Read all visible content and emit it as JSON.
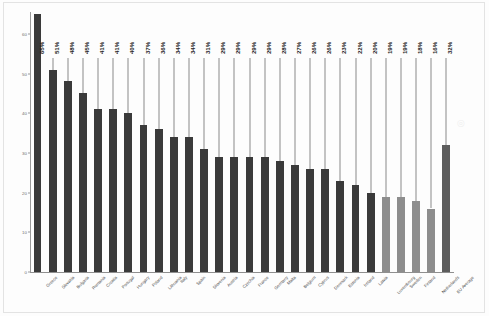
{
  "chart_data": {
    "type": "bar",
    "title": "",
    "subtitle": "",
    "xlabel": "",
    "ylabel": "",
    "ylim": [
      0,
      65
    ],
    "yticks": [
      0,
      10,
      20,
      30,
      40,
      50,
      60
    ],
    "grid": false,
    "legend_position": "none",
    "value_label_suffix": "%",
    "categories": [
      "Greece",
      "Slovakia",
      "Bulgaria",
      "Romania",
      "Croatia",
      "Portugal",
      "Hungary",
      "Poland",
      "Lithuania",
      "Italy",
      "Spain",
      "Slovenia",
      "Austria",
      "Czechia",
      "France",
      "Germany",
      "Malta",
      "Belgium",
      "Cyprus",
      "Denmark",
      "Estonia",
      "Ireland",
      "Latvia",
      "Luxembourg",
      "Sweden",
      "Finland",
      "Netherlands",
      "EU Average"
    ],
    "values": [
      65,
      51,
      48,
      45,
      41,
      41,
      40,
      37,
      36,
      34,
      34,
      31,
      29,
      29,
      29,
      29,
      28,
      27,
      26,
      26,
      23,
      22,
      20,
      19,
      19,
      18,
      16,
      32
    ],
    "value_labels": [
      "65%",
      "51%",
      "48%",
      "45%",
      "41%",
      "41%",
      "40%",
      "37%",
      "36%",
      "34%",
      "34%",
      "31%",
      "29%",
      "29%",
      "29%",
      "29%",
      "28%",
      "27%",
      "26%",
      "26%",
      "23%",
      "22%",
      "20%",
      "19%",
      "19%",
      "18%",
      "16%",
      "32%"
    ],
    "bar_shades": [
      "dark",
      "dark",
      "dark",
      "dark",
      "dark",
      "dark",
      "dark",
      "dark",
      "dark",
      "dark",
      "dark",
      "dark",
      "dark",
      "dark",
      "dark",
      "dark",
      "dark",
      "dark",
      "dark",
      "dark",
      "dark",
      "dark",
      "dark",
      "light",
      "light",
      "light",
      "light",
      "mid"
    ],
    "colors": {
      "bar_dark": "#3a3a3a",
      "bar_mid": "#5c5c5c",
      "bar_light": "#8d8d8d",
      "axis": "#8f8f8f",
      "leader_line": "#8a8a8a",
      "label_text": "#1d1d1d",
      "tick_text": "#6f6f6f",
      "background": "#fdfdfd"
    }
  }
}
